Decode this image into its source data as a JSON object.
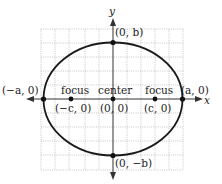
{
  "diagram": {
    "type": "ellipse",
    "axes": {
      "x_label": "x",
      "y_label": "y"
    },
    "grid": {
      "step_px": 14,
      "left": 41,
      "right": 183,
      "top": 29,
      "bottom": 170
    },
    "center_px": {
      "x": 113,
      "y": 99
    },
    "ellipse_px": {
      "rx": 69.5,
      "ry": 56.5
    },
    "colors": {
      "curve": "#1a1a1a",
      "axis": "#333333",
      "grid": "#b8b8b8",
      "point": "#111111"
    },
    "points": [
      {
        "id": "vertex-left",
        "label": "(−a, 0)",
        "px": 43.5,
        "py": 99
      },
      {
        "id": "vertex-right",
        "label": "(a, 0)",
        "px": 182.5,
        "py": 99
      },
      {
        "id": "covertex-top",
        "label": "(0, b)",
        "px": 113,
        "py": 42.5
      },
      {
        "id": "covertex-bottom",
        "label": "(0, −b)",
        "px": 113,
        "py": 155.5
      },
      {
        "id": "focus-left",
        "label": "(−c, 0)",
        "name": "focus",
        "px": 71,
        "py": 99
      },
      {
        "id": "center",
        "label": "(0, 0)",
        "name": "center",
        "px": 113,
        "py": 99
      },
      {
        "id": "focus-right",
        "label": "(c, 0)",
        "name": "focus",
        "px": 155,
        "py": 99
      }
    ],
    "labels": {
      "y_axis": "y",
      "x_axis": "x",
      "top": "(0, b)",
      "bottom": "(0, −b)",
      "left": "(−a, 0)",
      "right": "(a, 0)",
      "focus_left_name": "focus",
      "focus_left_coord": "(−c, 0)",
      "center_name": "center",
      "center_coord": "(0, 0)",
      "focus_right_name": "focus",
      "focus_right_coord": "(c, 0)"
    }
  }
}
